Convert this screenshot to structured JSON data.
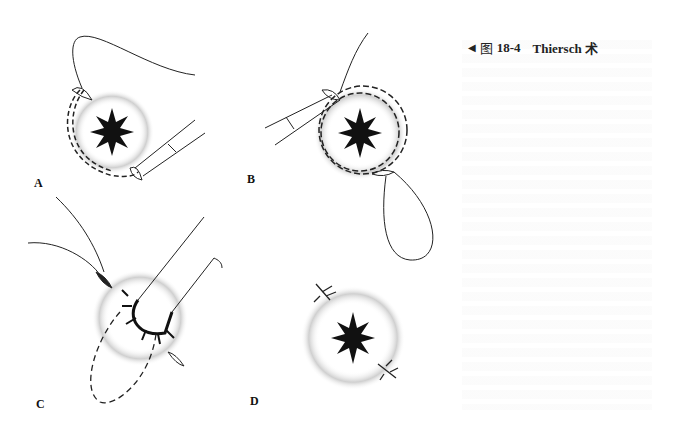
{
  "figure": {
    "caption": {
      "pointer_icon": "left-triangle-icon",
      "prefix": "图",
      "number": "18-4",
      "title": "Thiersch 术"
    },
    "panels": [
      {
        "label": "A",
        "description": "Needle passed around anal orifice with dashed suture path"
      },
      {
        "label": "B",
        "description": "Needle completing circumferential suture with thread loop"
      },
      {
        "label": "C",
        "description": "Finger inserted into anus while suture is tightened"
      },
      {
        "label": "D",
        "description": "Suture tied, knots visible at two points"
      }
    ]
  }
}
